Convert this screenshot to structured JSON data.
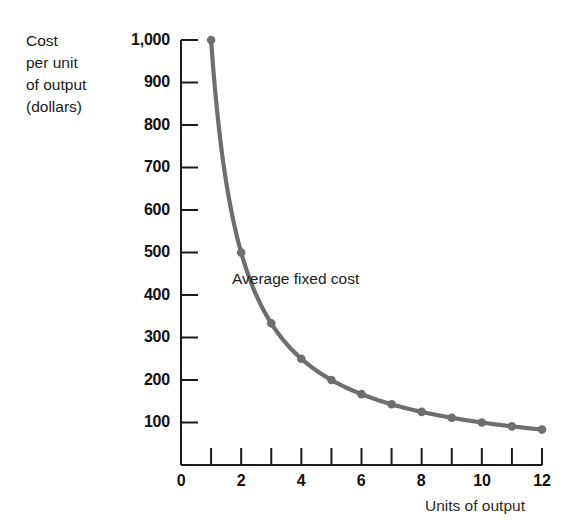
{
  "figure": {
    "background_color": "#ffffff",
    "curve_color": "#6e6e6e",
    "axis_color": "#1a1a1a",
    "text_color": "#1a1a1a"
  },
  "axis": {
    "y_title": "Cost\nper unit\nof output\n(dollars)",
    "x_title": "Units of output",
    "y_tick_labels": [
      "1,000",
      "900",
      "800",
      "700",
      "600",
      "500",
      "400",
      "300",
      "200",
      "100"
    ],
    "y_tick_values": [
      1000,
      900,
      800,
      700,
      600,
      500,
      400,
      300,
      200,
      100
    ],
    "x_tick_labels": [
      "0",
      "2",
      "4",
      "6",
      "8",
      "10",
      "12"
    ],
    "x_tick_values": [
      0,
      2,
      4,
      6,
      8,
      10,
      12
    ],
    "x_minor_ticks": [
      1,
      2,
      3,
      4,
      5,
      6,
      7,
      8,
      9,
      10,
      11,
      12
    ]
  },
  "series": {
    "label": "Average fixed cost"
  },
  "chart_data": {
    "type": "line",
    "title": "",
    "subtitle": "",
    "xlabel": "Units of output",
    "ylabel": "Cost per unit of output (dollars)",
    "xlim": [
      0,
      12
    ],
    "ylim": [
      0,
      1000
    ],
    "grid": false,
    "legend": "inline-annotation",
    "annotations": [
      {
        "text": "Average fixed cost",
        "x": 3.3,
        "y": 430
      }
    ],
    "series": [
      {
        "name": "Average fixed cost",
        "marker": "circle",
        "color": "#6e6e6e",
        "x": [
          1,
          2,
          3,
          4,
          5,
          6,
          7,
          8,
          9,
          10,
          11,
          12
        ],
        "values": [
          1000,
          500,
          333,
          250,
          200,
          167,
          143,
          125,
          111,
          100,
          91,
          83
        ]
      }
    ]
  }
}
